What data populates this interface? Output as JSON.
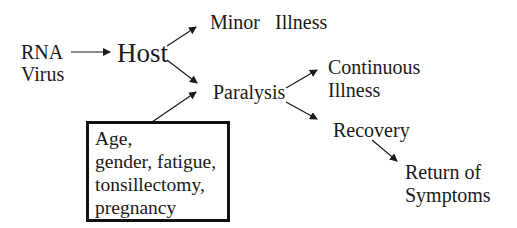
{
  "diagram": {
    "nodes": {
      "rna_virus": {
        "line1": "RNA",
        "line2": "Virus"
      },
      "host": {
        "label": "Host"
      },
      "minor_illness": {
        "label": "Minor   Illness"
      },
      "paralysis": {
        "label": "Paralysis"
      },
      "continuous_illness": {
        "line1": "Continuous",
        "line2": "Illness"
      },
      "recovery": {
        "label": "Recovery"
      },
      "return_of_symptoms": {
        "line1": "Return of",
        "line2": "Symptoms"
      }
    },
    "factor_box": {
      "lines": [
        "Age,",
        "gender, fatigue,",
        "tonsillectomy,",
        "pregnancy"
      ]
    },
    "edges": [
      {
        "from": "rna_virus",
        "to": "host"
      },
      {
        "from": "host",
        "to": "minor_illness"
      },
      {
        "from": "host",
        "to": "paralysis"
      },
      {
        "from": "factor_box",
        "to": "paralysis"
      },
      {
        "from": "paralysis",
        "to": "continuous_illness"
      },
      {
        "from": "paralysis",
        "to": "recovery"
      },
      {
        "from": "recovery",
        "to": "return_of_symptoms"
      }
    ],
    "colors": {
      "ink": "#1a1a1a",
      "background": "#ffffff"
    }
  }
}
